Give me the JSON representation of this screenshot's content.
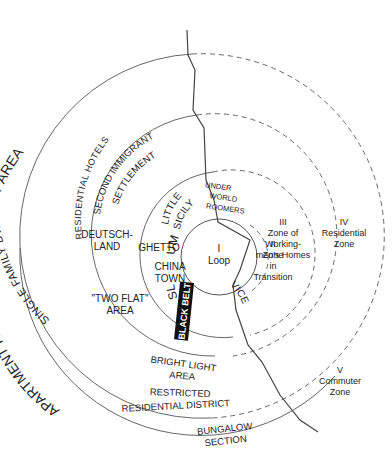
{
  "diagram": {
    "colors": {
      "line": "#555555",
      "text": "#222222",
      "black_belt_bg": "#111111",
      "black_belt_text": "#ffffff"
    },
    "zones": {
      "I": {
        "numeral": "I",
        "line1": "Loop"
      },
      "II": {
        "numeral": "II",
        "line1": "Zone",
        "line2": "in",
        "line3": "Transition"
      },
      "III": {
        "numeral": "III",
        "line1": "Zone of",
        "line2": "Working-",
        "line3": "men's Homes"
      },
      "IV": {
        "numeral": "IV",
        "line1": "Residential",
        "line2": "Zone"
      },
      "V": {
        "numeral": "V",
        "line1": "Commuter",
        "line2": "Zone"
      }
    },
    "arc_labels": {
      "single_family": "SINGLE FAMILY DWELLINGS",
      "residential_hotels": "RESIDENTIAL HOTELS",
      "apartment_houses": "APARTMENT HOUSES BRIGHT LIGHT AREA",
      "second_immigrant": "SECOND IMMIGRANT",
      "settlement": "SETTLEMENT",
      "little": "LITTLE",
      "sicily": "SICILY",
      "um": "UM",
      "sl": "SL",
      "vice": "VICE"
    },
    "area_labels": {
      "under": "UNDER",
      "world": "WORLD",
      "roomers": "ROOMERS",
      "deutsch": "DEUTSCH-",
      "land": "LAND",
      "ghetto": "GHETTO",
      "china": "CHINA",
      "town": "TOWN",
      "two_flat": "\"TWO FLAT\"",
      "area": "AREA",
      "black_belt": "BLACK BELT",
      "bright_light_1": "BRIGHT LIGHT",
      "bright_light_2": "AREA",
      "restricted_1": "RESTRICTED",
      "restricted_2": "RESIDENTIAL DISTRICT",
      "bungalow_1": "BUNGALOW",
      "bungalow_2": "SECTION"
    }
  }
}
